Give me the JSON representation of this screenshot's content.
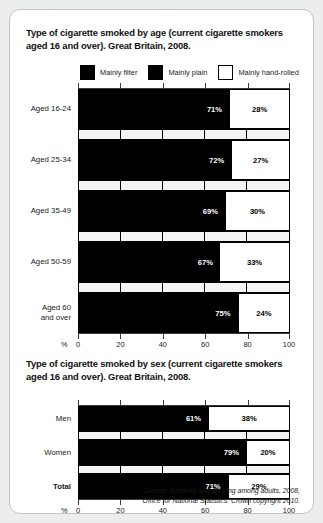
{
  "card": {
    "source_line1": "Source: Smoking and drinking among adults, 2008,",
    "source_line2": "Office for National Statistics. Crown copyright 2010."
  },
  "legend": {
    "items": [
      {
        "label": "Mainly filter",
        "swatch": "black",
        "icon": "legend-swatch-icon"
      },
      {
        "label": "Mainly plain",
        "swatch": "black",
        "icon": "legend-swatch-icon"
      },
      {
        "label": "Mainly hand-rolled",
        "swatch": "white",
        "icon": "legend-swatch-icon"
      }
    ]
  },
  "chart_data": [
    {
      "type": "bar",
      "orientation": "horizontal",
      "stacked": true,
      "title": "Type of cigarette smoked by age (current cigarette smokers aged 16 and over). Great Britain, 2008.",
      "xlabel": "%",
      "ylabel": "",
      "xlim": [
        0,
        100
      ],
      "xticks": [
        0,
        20,
        40,
        60,
        80,
        100
      ],
      "xticklabels": [
        "0",
        "20",
        "40",
        "60",
        "80",
        "100"
      ],
      "grid": false,
      "legend_position": "top",
      "categories": [
        "Aged 16-24",
        "Aged 25-34",
        "Aged 35-49",
        "Aged 50-59",
        "Aged 60 and over"
      ],
      "category_lines": [
        [
          "Aged 16-24"
        ],
        [
          "Aged 25-34"
        ],
        [
          "Aged 35-49"
        ],
        [
          "Aged 50-59"
        ],
        [
          "Aged 60",
          "and over"
        ]
      ],
      "series": [
        {
          "name": "Mainly filter",
          "values": [
            71,
            72,
            69,
            67,
            75
          ],
          "labels": [
            "71%",
            "72%",
            "69%",
            "67%",
            "75%"
          ]
        },
        {
          "name": "Mainly plain",
          "values": [
            1,
            1,
            1,
            0,
            1
          ],
          "labels": [
            "1",
            "1",
            "1",
            "",
            "1"
          ]
        },
        {
          "name": "Mainly hand-rolled",
          "values": [
            28,
            27,
            30,
            33,
            24
          ],
          "labels": [
            "28%",
            "27%",
            "30%",
            "33%",
            "24%"
          ]
        }
      ]
    },
    {
      "type": "bar",
      "orientation": "horizontal",
      "stacked": true,
      "title": "Type of cigarette smoked by sex (current cigarette smokers aged 16 and over). Great Britain, 2008.",
      "xlabel": "%",
      "ylabel": "",
      "xlim": [
        0,
        100
      ],
      "xticks": [
        0,
        20,
        40,
        60,
        80,
        100
      ],
      "xticklabels": [
        "0",
        "20",
        "40",
        "60",
        "80",
        "100"
      ],
      "grid": false,
      "legend_position": "none",
      "categories": [
        "Men",
        "Women",
        "Total"
      ],
      "category_lines": [
        [
          "Men"
        ],
        [
          "Women"
        ],
        [
          "Total"
        ]
      ],
      "category_bold": [
        false,
        false,
        true
      ],
      "series": [
        {
          "name": "Mainly filter",
          "values": [
            61,
            79,
            71
          ],
          "labels": [
            "61%",
            "79%",
            "71%"
          ]
        },
        {
          "name": "Mainly plain",
          "values": [
            1,
            1,
            1
          ],
          "labels": [
            "",
            "1",
            "1"
          ]
        },
        {
          "name": "Mainly hand-rolled",
          "values": [
            38,
            20,
            29
          ],
          "labels": [
            "38%",
            "20%",
            "29%"
          ]
        }
      ]
    }
  ]
}
